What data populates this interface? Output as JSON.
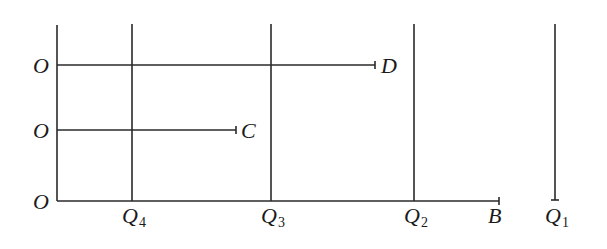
{
  "diagram": {
    "type": "line-segment diagram",
    "colors": {
      "line": "#2a2a2a",
      "text": "#1a1a1a",
      "background": "#ffffff"
    },
    "origin_labels": [
      {
        "text": "O",
        "row": "top"
      },
      {
        "text": "O",
        "row": "middle"
      },
      {
        "text": "O",
        "row": "bottom"
      }
    ],
    "segments": [
      {
        "from": "O",
        "to": "D",
        "end_label": "D"
      },
      {
        "from": "O",
        "to": "C",
        "end_label": "C"
      },
      {
        "from": "O",
        "to": "B",
        "end_label": "B"
      }
    ],
    "vertical_lines": [
      {
        "label": "Q",
        "subscript": "4"
      },
      {
        "label": "Q",
        "subscript": "3"
      },
      {
        "label": "Q",
        "subscript": "2"
      },
      {
        "label": "Q",
        "subscript": "1"
      }
    ]
  }
}
